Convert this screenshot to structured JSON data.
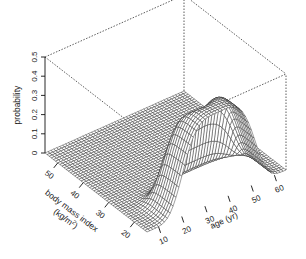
{
  "chart_data": {
    "type": "surface3d",
    "title": "",
    "zlabel": "probability",
    "xlabel": "age (yr)",
    "ylabel": "body mass index (kg/m2)",
    "ylabel_lines": [
      "body mass index",
      "(kg/m",
      "2",
      ")"
    ],
    "z_ticks": [
      0,
      0.1,
      0.2,
      0.3,
      0.4,
      0.5
    ],
    "z_tick_labels": [
      "0",
      "0.1",
      "0.2",
      "0.3",
      "0.4",
      "0.5"
    ],
    "x_ticks": [
      10,
      20,
      30,
      40,
      50,
      60
    ],
    "x_tick_labels": [
      "10",
      "20",
      "30",
      "40",
      "50",
      "60"
    ],
    "y_ticks": [
      20,
      30,
      40,
      50
    ],
    "y_tick_labels": [
      "20",
      "30",
      "40",
      "50"
    ],
    "xlim": [
      5,
      65
    ],
    "ylim": [
      15,
      55
    ],
    "zlim": [
      0,
      0.5
    ],
    "grid": false,
    "box": "dotted",
    "surface_description": "Probability surface as function of age and BMI; near 0 for BMI > ~27, rising steeply for BMI below ~25 at ages ~10-60, peaking ~0.45 near age 30-40 and BMI ~18-20, with a ridge/dip around age 35",
    "peak": {
      "age": 35,
      "bmi": 19,
      "probability": 0.45
    }
  }
}
